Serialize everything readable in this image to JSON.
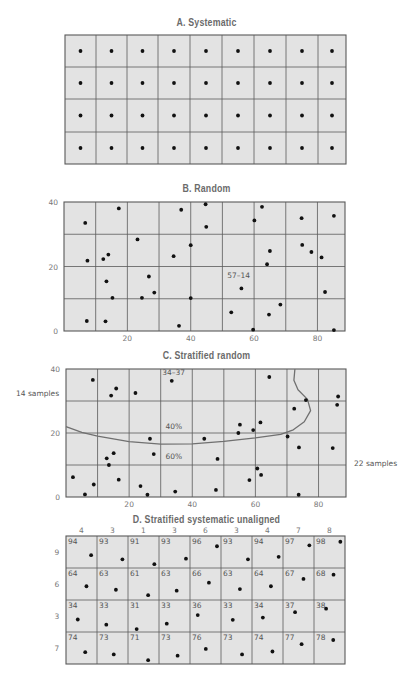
{
  "colors": {
    "cell_fill": "#e3e3e3",
    "grid_line": "#5a5a5a",
    "dot": "#111111",
    "curve": "#707070",
    "title": "#6b6b6b"
  },
  "panels": {
    "a": {
      "title": "A.  Systematic",
      "columns": 9,
      "rows": 4,
      "col_edges_px": [
        65,
        96,
        127,
        158,
        190,
        222,
        254,
        286,
        318,
        346
      ],
      "row_edges_px": [
        35,
        67,
        99,
        132,
        164
      ],
      "dot_fraction": [
        0.5,
        0.5
      ]
    },
    "b": {
      "title": "B.  Random",
      "x_ticks": [
        "20",
        "40",
        "60",
        "80"
      ],
      "y_ticks": [
        "0",
        "20",
        "40"
      ],
      "annotation": "57–14",
      "annotation_pos": [
        51.5,
        16.5
      ],
      "points": [
        [
          6.7,
          33.5
        ],
        [
          17.3,
          38
        ],
        [
          7.4,
          21.8
        ],
        [
          12.4,
          22.3
        ],
        [
          14,
          23.7
        ],
        [
          23.2,
          28.4
        ],
        [
          13.4,
          15.4
        ],
        [
          15.3,
          10.3
        ],
        [
          7.2,
          3.1
        ],
        [
          13.1,
          3
        ],
        [
          26.8,
          16.9
        ],
        [
          24.6,
          10.3
        ],
        [
          28.5,
          11.9
        ],
        [
          37,
          37.6
        ],
        [
          34.6,
          23.2
        ],
        [
          40,
          26.6
        ],
        [
          40,
          10.2
        ],
        [
          36.3,
          1.6
        ],
        [
          44.7,
          39.3
        ],
        [
          44.9,
          32.3
        ],
        [
          52.8,
          5.8
        ],
        [
          56,
          13.2
        ],
        [
          59.7,
          0.4
        ],
        [
          60.1,
          34.3
        ],
        [
          62.5,
          38.5
        ],
        [
          65,
          24.8
        ],
        [
          64.1,
          20.7
        ],
        [
          64.7,
          5.1
        ],
        [
          68.3,
          8.2
        ],
        [
          75,
          35
        ],
        [
          75.2,
          26.7
        ],
        [
          78.1,
          24.5
        ],
        [
          81.3,
          22.8
        ],
        [
          82.4,
          12.1
        ],
        [
          85.2,
          35.7
        ],
        [
          85.2,
          0.3
        ]
      ]
    },
    "c": {
      "title": "C.  Stratified   random",
      "x_ticks": [
        "20",
        "40",
        "60",
        "80"
      ],
      "y_ticks": [
        "0",
        "20",
        "40"
      ],
      "annotations": [
        {
          "text": "34–37",
          "pos": [
            30.5,
            38.2
          ]
        },
        {
          "text": "40%",
          "pos": [
            31.5,
            21.2
          ]
        },
        {
          "text": "60%",
          "pos": [
            31.5,
            11.8
          ]
        }
      ],
      "left_label": "14 samples",
      "right_label": "22 samples",
      "boundary_curve": [
        [
          0,
          22
        ],
        [
          5,
          20.2
        ],
        [
          10,
          19
        ],
        [
          20,
          17.3
        ],
        [
          30,
          16.5
        ],
        [
          40,
          16.6
        ],
        [
          50,
          17.4
        ],
        [
          60,
          18.5
        ],
        [
          68,
          19.6
        ],
        [
          72,
          21
        ],
        [
          75.5,
          23.5
        ],
        [
          77.5,
          27
        ],
        [
          76.5,
          30.5
        ],
        [
          73.5,
          33.5
        ],
        [
          72.2,
          36.5
        ],
        [
          72.5,
          40
        ]
      ],
      "points": [
        [
          8.5,
          36.6
        ],
        [
          14.3,
          31.7
        ],
        [
          15.9,
          33.9
        ],
        [
          22,
          32.5
        ],
        [
          33.5,
          36.3
        ],
        [
          64.4,
          37.5
        ],
        [
          76,
          30.3
        ],
        [
          72.3,
          27.6
        ],
        [
          86.2,
          31.4
        ],
        [
          85.9,
          28.8
        ],
        [
          55.1,
          22.6
        ],
        [
          54.6,
          20
        ],
        [
          59.3,
          20.9
        ],
        [
          61.6,
          23.3
        ],
        [
          43.8,
          18.2
        ],
        [
          26.6,
          18.2
        ],
        [
          70.2,
          18.9
        ],
        [
          73.8,
          15.5
        ],
        [
          84.5,
          15.3
        ],
        [
          27.8,
          13.4
        ],
        [
          48,
          11.9
        ],
        [
          12.9,
          12.1
        ],
        [
          15.1,
          13.7
        ],
        [
          13.6,
          10
        ],
        [
          2.2,
          6.2
        ],
        [
          16.7,
          5.4
        ],
        [
          8.8,
          3.9
        ],
        [
          6,
          0.8
        ],
        [
          23.6,
          3.4
        ],
        [
          25.8,
          0.7
        ],
        [
          34.6,
          1.7
        ],
        [
          47.5,
          2.2
        ],
        [
          58.1,
          5.3
        ],
        [
          60.6,
          8.9
        ],
        [
          61.8,
          6.9
        ],
        [
          73.7,
          0.7
        ]
      ]
    },
    "d": {
      "title": "D.  Stratified   systematic   unaligned",
      "column_headers": [
        "4",
        "3",
        "1",
        "3",
        "6",
        "3",
        "4",
        "7",
        "8"
      ],
      "row_labels": [
        "9",
        "6",
        "3",
        "7"
      ],
      "cell_numbers": [
        [
          "94",
          "93",
          "91",
          "93",
          "96",
          "93",
          "94",
          "97",
          "98"
        ],
        [
          "64",
          "63",
          "61",
          "63",
          "66",
          "63",
          "64",
          "67",
          "68"
        ],
        [
          "34",
          "33",
          "31",
          "33",
          "36",
          "33",
          "34",
          "37",
          "38"
        ],
        [
          "74",
          "73",
          "71",
          "73",
          "76",
          "73",
          "74",
          "77",
          "78"
        ]
      ],
      "dot_x_fraction": [
        [
          0.81,
          0.82,
          0.85,
          0.87,
          0.87,
          0.87,
          0.86,
          0.85,
          0.85
        ],
        [
          0.66,
          0.61,
          0.65,
          0.57,
          0.61,
          0.61,
          0.61,
          0.66,
          0.63
        ],
        [
          0.38,
          0.3,
          0.28,
          0.25,
          0.25,
          0.38,
          0.35,
          0.39,
          0.39
        ],
        [
          0.62,
          0.54,
          0.65,
          0.6,
          0.51,
          0.68,
          0.66,
          0.6,
          0.62
        ]
      ],
      "dot_y_fraction": [
        [
          0.6,
          0.73,
          0.88,
          0.71,
          0.32,
          0.73,
          0.65,
          0.29,
          0.18
        ],
        [
          0.57,
          0.68,
          0.85,
          0.71,
          0.46,
          0.66,
          0.57,
          0.34,
          0.21
        ],
        [
          0.61,
          0.77,
          0.91,
          0.74,
          0.47,
          0.62,
          0.55,
          0.38,
          0.27
        ],
        [
          0.63,
          0.7,
          0.88,
          0.74,
          0.53,
          0.7,
          0.61,
          0.38,
          0.25
        ]
      ]
    }
  }
}
